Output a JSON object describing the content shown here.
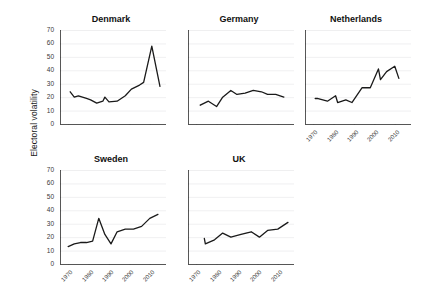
{
  "figure": {
    "ylabel": "Electoral volatility",
    "panel_titles": [
      "Denmark",
      "Germany",
      "Netherlands",
      "Sweden",
      "UK"
    ]
  },
  "chart_data": {
    "type": "line",
    "title": "",
    "subtitle": "",
    "xlabel": "",
    "ylabel": "Electoral volatility",
    "xlim": [
      1966,
      2016
    ],
    "ylim": [
      0,
      70
    ],
    "yticks": [
      0,
      10,
      20,
      30,
      40,
      50,
      60,
      70
    ],
    "xticks": [
      1970,
      1980,
      1990,
      2000,
      2010
    ],
    "xtick_labels": [
      "1970",
      "1980",
      "1990",
      "2000",
      "2010"
    ],
    "ytick_labels": [
      "0",
      "10",
      "20",
      "30",
      "40",
      "50",
      "60",
      "70"
    ],
    "grid": true,
    "grid_axis": "y",
    "legend": "none",
    "line_color": "#1a1a1a",
    "layout": "small-multiples 2 rows x 3 columns, last cell empty",
    "panels": [
      {
        "name": "Denmark",
        "row": 0,
        "col": 0,
        "x": [
          1971,
          1973,
          1975,
          1977,
          1979,
          1981,
          1984,
          1987,
          1988,
          1990,
          1994,
          1998,
          2001,
          2005,
          2007,
          2011,
          2015
        ],
        "y": [
          24,
          20,
          21,
          20,
          19,
          18,
          15.5,
          17,
          20,
          16.5,
          17,
          21,
          26,
          29,
          31,
          58,
          28
        ]
      },
      {
        "name": "Germany",
        "row": 0,
        "col": 1,
        "x": [
          1972,
          1976,
          1980,
          1983,
          1987,
          1990,
          1994,
          1998,
          2002,
          2005,
          2009,
          2013
        ],
        "y": [
          14,
          17,
          13,
          20,
          25,
          22,
          23,
          25,
          24,
          22,
          22,
          20
        ]
      },
      {
        "name": "Netherlands",
        "row": 0,
        "col": 2,
        "x": [
          1971,
          1972,
          1977,
          1981,
          1982,
          1986,
          1989,
          1994,
          1998,
          2002,
          2003,
          2006,
          2010,
          2012
        ],
        "y": [
          19,
          19,
          17,
          21,
          16,
          18,
          16,
          27,
          27,
          41,
          33,
          39,
          43,
          34
        ]
      },
      {
        "name": "Sweden",
        "row": 1,
        "col": 0,
        "x": [
          1970,
          1973,
          1976,
          1979,
          1982,
          1985,
          1988,
          1991,
          1994,
          1998,
          2002,
          2006,
          2010,
          2014
        ],
        "y": [
          13,
          15,
          16,
          16,
          17,
          34,
          22,
          15,
          24,
          26,
          26,
          28,
          34,
          37
        ]
      },
      {
        "name": "UK",
        "row": 1,
        "col": 1,
        "x": [
          1974,
          1974.5,
          1979,
          1983,
          1987,
          1992,
          1997,
          2001,
          2005,
          2010,
          2015
        ],
        "y": [
          19,
          15,
          18,
          23,
          20,
          22,
          24,
          20,
          25,
          26,
          31
        ]
      }
    ]
  }
}
